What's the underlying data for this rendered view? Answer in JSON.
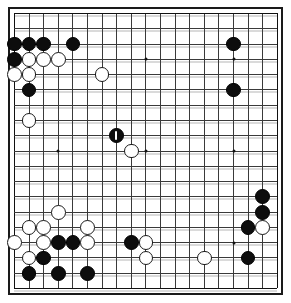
{
  "board": {
    "title": "Go board diagram",
    "size": 19,
    "origin_x": 6,
    "origin_y": 6,
    "spacing_x": 14.6,
    "spacing_y": 15.28,
    "stone_radius": 7.4,
    "colors": {
      "background": "#ffffff",
      "line": "#3a3a3a",
      "border": "#1a1a1a",
      "black_stone": "#0d0d0d",
      "white_stone": "#ffffff",
      "white_stone_edge": "#1a1a1a",
      "hoshi": "#111111",
      "marker": "#ffffff"
    },
    "hoshi_points": [
      {
        "col": 4,
        "row": 4
      },
      {
        "col": 10,
        "row": 4
      },
      {
        "col": 16,
        "row": 4
      },
      {
        "col": 4,
        "row": 10
      },
      {
        "col": 10,
        "row": 10
      },
      {
        "col": 16,
        "row": 10
      },
      {
        "col": 4,
        "row": 16
      },
      {
        "col": 10,
        "row": 16
      },
      {
        "col": 16,
        "row": 16
      }
    ],
    "stones": [
      {
        "col": 1,
        "row": 3,
        "color": "black"
      },
      {
        "col": 2,
        "row": 3,
        "color": "black"
      },
      {
        "col": 3,
        "row": 3,
        "color": "black"
      },
      {
        "col": 5,
        "row": 3,
        "color": "black"
      },
      {
        "col": 16,
        "row": 3,
        "color": "black"
      },
      {
        "col": 1,
        "row": 4,
        "color": "black"
      },
      {
        "col": 2,
        "row": 4,
        "color": "white"
      },
      {
        "col": 3,
        "row": 4,
        "color": "white"
      },
      {
        "col": 4,
        "row": 4,
        "color": "white"
      },
      {
        "col": 1,
        "row": 5,
        "color": "white"
      },
      {
        "col": 2,
        "row": 5,
        "color": "white"
      },
      {
        "col": 7,
        "row": 5,
        "color": "white"
      },
      {
        "col": 2,
        "row": 6,
        "color": "black"
      },
      {
        "col": 16,
        "row": 6,
        "color": "black"
      },
      {
        "col": 2,
        "row": 8,
        "color": "white"
      },
      {
        "col": 8,
        "row": 9,
        "color": "black",
        "marked": true,
        "label": "1"
      },
      {
        "col": 9,
        "row": 10,
        "color": "white"
      },
      {
        "col": 18,
        "row": 13,
        "color": "black"
      },
      {
        "col": 18,
        "row": 14,
        "color": "black"
      },
      {
        "col": 4,
        "row": 14,
        "color": "white"
      },
      {
        "col": 2,
        "row": 15,
        "color": "white"
      },
      {
        "col": 3,
        "row": 15,
        "color": "white"
      },
      {
        "col": 6,
        "row": 15,
        "color": "white"
      },
      {
        "col": 17,
        "row": 15,
        "color": "black"
      },
      {
        "col": 18,
        "row": 15,
        "color": "white"
      },
      {
        "col": 1,
        "row": 16,
        "color": "white"
      },
      {
        "col": 3,
        "row": 16,
        "color": "white"
      },
      {
        "col": 4,
        "row": 16,
        "color": "black"
      },
      {
        "col": 5,
        "row": 16,
        "color": "black"
      },
      {
        "col": 6,
        "row": 16,
        "color": "white"
      },
      {
        "col": 9,
        "row": 16,
        "color": "black"
      },
      {
        "col": 10,
        "row": 16,
        "color": "white"
      },
      {
        "col": 2,
        "row": 17,
        "color": "white"
      },
      {
        "col": 3,
        "row": 17,
        "color": "black"
      },
      {
        "col": 10,
        "row": 17,
        "color": "white"
      },
      {
        "col": 14,
        "row": 17,
        "color": "white"
      },
      {
        "col": 17,
        "row": 17,
        "color": "black"
      },
      {
        "col": 2,
        "row": 18,
        "color": "black"
      },
      {
        "col": 4,
        "row": 18,
        "color": "black"
      },
      {
        "col": 6,
        "row": 18,
        "color": "black"
      }
    ]
  }
}
